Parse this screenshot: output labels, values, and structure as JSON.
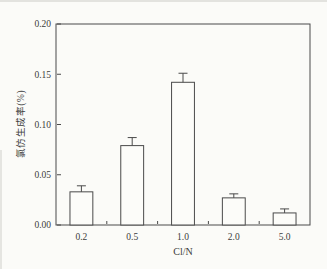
{
  "figure": {
    "background": "#fbfbf8",
    "axis_color": "#4a4a4a",
    "bar_fill": "#fcfcf9",
    "bar_stroke": "#4a4a4a",
    "text_color": "#3b3b3b"
  },
  "chart_data": {
    "type": "bar",
    "title": "",
    "xlabel": "Cl/N",
    "ylabel": "氯仿生成率(%)",
    "categories": [
      "0.2",
      "0.5",
      "1.0",
      "2.0",
      "5.0"
    ],
    "values": [
      0.033,
      0.079,
      0.142,
      0.027,
      0.012
    ],
    "errors_upper": [
      0.006,
      0.008,
      0.009,
      0.004,
      0.004
    ],
    "ylim": [
      0.0,
      0.2
    ],
    "y_ticks": [
      0.0,
      0.05,
      0.1,
      0.15,
      0.2
    ],
    "y_tick_labels": [
      "0.00",
      "0.05",
      "0.10",
      "0.15",
      "0.20"
    ],
    "grid": false,
    "legend": "none",
    "bar_color": "white with dark outline",
    "error_bars": "upper whisker with cap"
  }
}
